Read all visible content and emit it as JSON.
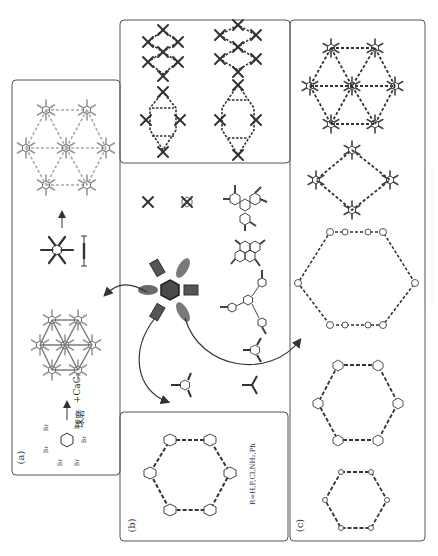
{
  "figure": {
    "orientation": "rotated-90-ccw",
    "colors": {
      "line": "#444444",
      "border": "#555555",
      "hub": "#4a4a4a",
      "hub_highlight": "#8a8a8a",
      "arrow": "#333333"
    }
  },
  "panels": {
    "a": {
      "label": "(a)",
      "reagent": "+CaC₂",
      "process": "球磨",
      "substituent": "Br",
      "description": "Hexabromobenzene + CaC2 ball milling to triangular framework; building block and linker shown"
    },
    "b": {
      "label": "(b)",
      "substituent_note": "R=H,F,Cl,NH₂,Ph",
      "substituent": "R",
      "description": "Hexagonal ring of substituted benzenes linked by butadiyne"
    },
    "c": {
      "label": "(c)",
      "description": "Series of graphdiyne-type networks with various nodes"
    },
    "top": {
      "description": "Rhombic / diamond network topologies"
    },
    "center": {
      "hub": "hexaethynylbenzene core",
      "building_blocks": [
        "tetraethynylethene",
        "tetraethynyl pyrazine",
        "hexaethynyl triphenylene",
        "tetraethynyl pyrene",
        "1,3,5-tris(ethynylphenyl)benzene",
        "triethynyl triazine",
        "triethynyl substituted benzene",
        "triethynyl node"
      ]
    }
  }
}
